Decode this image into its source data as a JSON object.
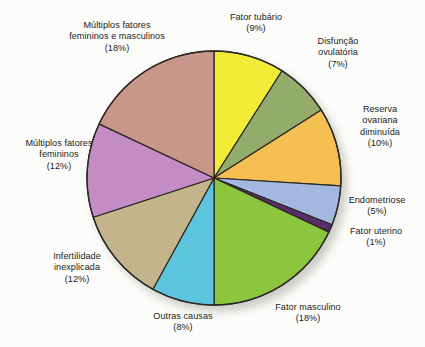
{
  "chart_data": {
    "type": "pie",
    "title": "",
    "subtitle": "",
    "xlabel": "",
    "ylabel": "",
    "legend_position": "none",
    "grid": false,
    "start_angle_deg": 0,
    "direction": "clockwise",
    "unit": "%",
    "categories": [
      "Fator tubário",
      "Disfunção ovulatória",
      "Reserva ovariana diminuída",
      "Endometriose",
      "Fator uterino",
      "Fator masculino",
      "Outras causas",
      "Infertilidade inexplicada",
      "Múltiplos fatores femininos",
      "Múltiplos fatores femininos e masculinos"
    ],
    "values": [
      9,
      7,
      10,
      5,
      1,
      18,
      8,
      12,
      12,
      18
    ],
    "colors": [
      "#f2ec38",
      "#93ab6b",
      "#f5bf52",
      "#a3b8e0",
      "#5c2d6b",
      "#8cc63f",
      "#5cc4dd",
      "#c4b48c",
      "#c48cc4",
      "#c9968a"
    ],
    "slices": [
      {
        "label": "Fator tubário",
        "value": 9,
        "value_text": "(9%)",
        "color": "#f2ec38",
        "name": "fator-tubario"
      },
      {
        "label": "Disfunção ovulatória",
        "value": 7,
        "value_text": "(7%)",
        "color": "#93ab6b",
        "name": "disfuncao-ovulatoria"
      },
      {
        "label": "Reserva ovariana diminuída",
        "value": 10,
        "value_text": "(10%)",
        "color": "#f5bf52",
        "name": "reserva-ovariana-diminuida"
      },
      {
        "label": "Endometriose",
        "value": 5,
        "value_text": "(5%)",
        "color": "#a3b8e0",
        "name": "endometriose"
      },
      {
        "label": "Fator uterino",
        "value": 1,
        "value_text": "(1%)",
        "color": "#5c2d6b",
        "name": "fator-uterino"
      },
      {
        "label": "Fator masculino",
        "value": 18,
        "value_text": "(18%)",
        "color": "#8cc63f",
        "name": "fator-masculino"
      },
      {
        "label": "Outras causas",
        "value": 8,
        "value_text": "(8%)",
        "color": "#5cc4dd",
        "name": "outras-causas"
      },
      {
        "label": "Infertilidade inexplicada",
        "value": 12,
        "value_text": "(12%)",
        "color": "#c4b48c",
        "name": "infertilidade-inexplicada"
      },
      {
        "label": "Múltiplos fatores femininos",
        "value": 12,
        "value_text": "(12%)",
        "color": "#c48cc4",
        "name": "multiplos-fatores-femininos"
      },
      {
        "label": "Múltiplos fatores femininos e masculinos",
        "value": 18,
        "value_text": "(18%)",
        "color": "#c9968a",
        "name": "multiplos-fatores-femininos-masculinos"
      }
    ]
  },
  "labels": {
    "multiplos_fm": "Múltiplos fatores\nfemininos e masculinos\n(18%)",
    "tubario": "Fator tubário\n(9%)",
    "disfuncao": "Disfunção\novulatória\n(7%)",
    "reserva": "Reserva\novariana\ndiminuída\n(10%)",
    "endometriose": "Endometriose\n(5%)",
    "uterino": "Fator uterino\n(1%)",
    "masculino": "Fator masculino\n(18%)",
    "outras": "Outras causas\n(8%)",
    "infertilidade": "Infertilidade\ninexplicada\n(12%)",
    "multiplos_f": "Múltiplos fatores\nfemininos\n(12%)"
  },
  "style": {
    "background": "#fcfcfa",
    "outline_color": "#2a2724",
    "text_color": "#211d1b"
  }
}
